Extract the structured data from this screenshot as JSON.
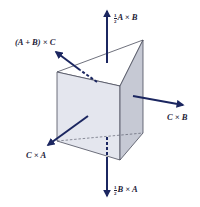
{
  "figure": {
    "colors": {
      "arrow": "#1b2660",
      "edge": "#4a4d5c",
      "front_face": "#e4e6ee",
      "side_face": "#c4c7d2",
      "top_face": "#ffffff",
      "label": "#1e2238"
    },
    "labels": {
      "top": {
        "coef_num": "1",
        "coef_den": "2",
        "text": "A × B"
      },
      "upper_left": {
        "text": "(A + B) × C"
      },
      "right": {
        "text": "C × B"
      },
      "lower_left": {
        "text": "C × A"
      },
      "bottom": {
        "coef_num": "1",
        "coef_den": "2",
        "text": "B × A"
      }
    }
  }
}
